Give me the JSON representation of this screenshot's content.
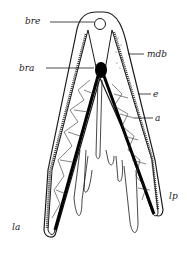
{
  "figure": {
    "type": "anatomical cross-section drawing",
    "labels": [
      {
        "id": "bre",
        "text": "bre",
        "x": 25,
        "y": 24
      },
      {
        "id": "mdb",
        "text": "mdb",
        "x": 147,
        "y": 57
      },
      {
        "id": "bra",
        "text": "bra",
        "x": 19,
        "y": 71
      },
      {
        "id": "e",
        "text": "e",
        "x": 153,
        "y": 97
      },
      {
        "id": "a",
        "text": "a",
        "x": 155,
        "y": 121
      },
      {
        "id": "lp",
        "text": "lp",
        "x": 169,
        "y": 199
      },
      {
        "id": "la",
        "text": "la",
        "x": 12,
        "y": 230
      }
    ],
    "colors": {
      "ink": "#1a1a1a",
      "paper": "#ffffff"
    }
  }
}
